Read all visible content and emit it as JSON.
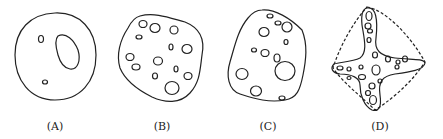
{
  "figure": {
    "panels": [
      {
        "id": "A",
        "label": "(A)",
        "description": "round outline with one large kidney-shaped inclusion and two small ovals"
      },
      {
        "id": "B",
        "label": "(B)",
        "description": "irregular polygonal outline with many oval inclusions"
      },
      {
        "id": "C",
        "label": "(C)",
        "description": "rough-edged irregular outline with oval inclusions of varying size"
      },
      {
        "id": "D",
        "label": "(D)",
        "description": "four-armed star shape with oval inclusions inside a dashed rounded envelope"
      }
    ],
    "stroke_color": "#222222",
    "background": "#ffffff"
  }
}
